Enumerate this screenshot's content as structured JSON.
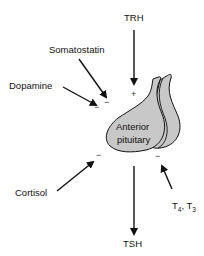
{
  "diagram": {
    "gland_label_line1": "Anterior",
    "gland_label_line2": "pituitary",
    "inputs": [
      {
        "label": "TRH",
        "effect": "+"
      },
      {
        "label": "Somatostatin",
        "effect": "−"
      },
      {
        "label": "Dopamine",
        "effect": "−"
      },
      {
        "label": "Cortisol",
        "effect": "−"
      },
      {
        "label": "T",
        "sub1": "4",
        "sep": ", T",
        "sub2": "3",
        "effect": "−"
      }
    ],
    "output": {
      "label": "TSH"
    },
    "colors": {
      "gland_fill": "#c8c8c8",
      "stroke": "#111111"
    }
  }
}
